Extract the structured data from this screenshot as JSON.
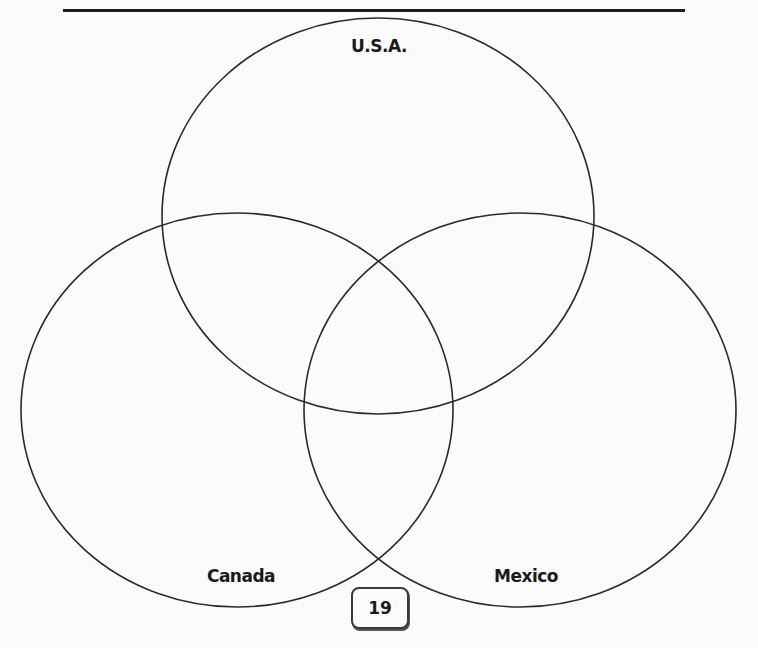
{
  "diagram": {
    "type": "venn-3-set",
    "sets": [
      {
        "id": "usa",
        "label": "U.S.A.",
        "cx": 378,
        "cy": 216,
        "rx": 216,
        "ry": 198
      },
      {
        "id": "canada",
        "label": "Canada",
        "cx": 237,
        "cy": 410,
        "rx": 216,
        "ry": 197
      },
      {
        "id": "mexico",
        "label": "Mexico",
        "cx": 520,
        "cy": 410,
        "rx": 216,
        "ry": 197
      }
    ],
    "stroke_color": "#2a2a2a",
    "background_color": "#fbfbfb"
  },
  "labels": {
    "usa": "U.S.A.",
    "canada": "Canada",
    "mexico": "Mexico"
  },
  "footer": {
    "page_number": "19"
  }
}
